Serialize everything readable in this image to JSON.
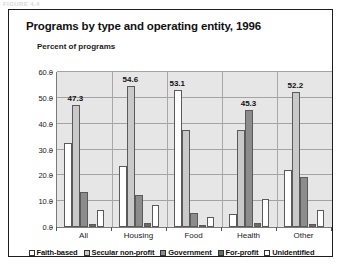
{
  "scan_artifact": {
    "top_strip_text": "FIGURE 4.4"
  },
  "figure": {
    "title": "Programs by type and operating entity, 1996",
    "axis_caption": "Percent of programs"
  },
  "chart_data": {
    "type": "bar",
    "title": "Programs by type and operating entity, 1996",
    "subtitle": "Percent of programs",
    "xlabel": "",
    "ylabel": "Percent of programs",
    "ylim": [
      0.0,
      60.0
    ],
    "yticks": [
      "0.0",
      "10.0",
      "20.0",
      "30.0",
      "40.0",
      "50.0",
      "60.0"
    ],
    "ytick_values": [
      0.0,
      10.0,
      20.0,
      30.0,
      40.0,
      50.0,
      60.0
    ],
    "grid": true,
    "legend_position": "bottom",
    "categories": [
      "All",
      "Housing",
      "Food",
      "Health",
      "Other"
    ],
    "series": [
      {
        "name": "Faith-based",
        "color": "#ffffff",
        "values": [
          32.5,
          23.5,
          53.1,
          5.0,
          22.0
        ]
      },
      {
        "name": "Secular non-profit",
        "color": "#c9c9c9",
        "values": [
          47.3,
          54.6,
          37.5,
          37.5,
          52.2
        ]
      },
      {
        "name": "Government",
        "color": "#8c8c8c",
        "values": [
          13.5,
          12.5,
          5.5,
          45.3,
          19.5
        ]
      },
      {
        "name": "For-profit",
        "color": "#6b6b6b",
        "values": [
          1.0,
          1.5,
          0.5,
          1.5,
          1.0
        ]
      },
      {
        "name": "Unidentified",
        "color": "#ffffff",
        "values": [
          6.5,
          8.5,
          4.0,
          11.0,
          6.5
        ]
      }
    ],
    "point_labels": [
      {
        "category": "All",
        "series": "Secular non-profit",
        "text": "47.3"
      },
      {
        "category": "Housing",
        "series": "Secular non-profit",
        "text": "54.6"
      },
      {
        "category": "Food",
        "series": "Faith-based",
        "text": "53.1"
      },
      {
        "category": "Health",
        "series": "Government",
        "text": "45.3"
      },
      {
        "category": "Other",
        "series": "Secular non-profit",
        "text": "52.2"
      }
    ]
  }
}
